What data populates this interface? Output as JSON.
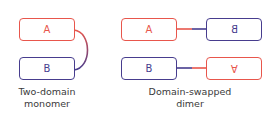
{
  "colors": {
    "domain_a": "#e8564c",
    "domain_b": "#473d8e"
  },
  "monomer": {
    "box_a": {
      "label": "A"
    },
    "box_b": {
      "label": "B"
    },
    "caption_line1": "Two-domain",
    "caption_line2": "monomer"
  },
  "dimer": {
    "row1": {
      "left_label": "A",
      "right_label": "B",
      "right_orientation": "mirrored"
    },
    "row2": {
      "left_label": "B",
      "right_label": "A",
      "right_orientation": "upside-down"
    },
    "caption_line1": "Domain-swapped",
    "caption_line2": "dimer"
  }
}
